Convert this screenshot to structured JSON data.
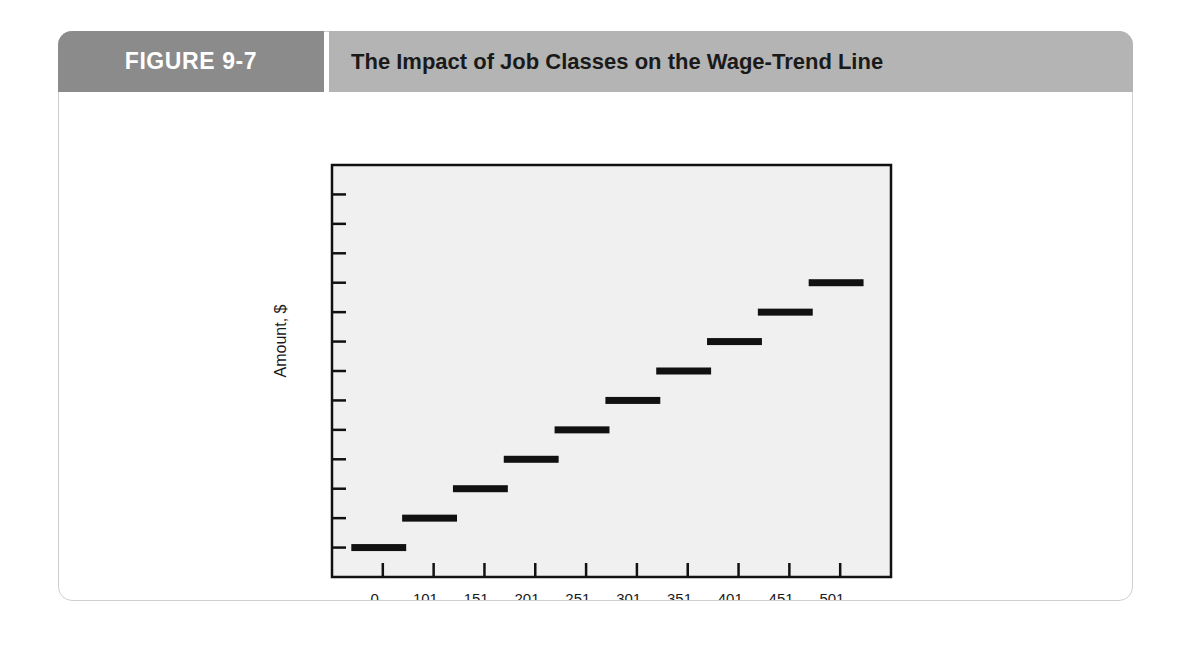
{
  "figure": {
    "number_label": "FIGURE 9-7",
    "title": "The Impact of Job Classes on the Wage-Trend Line"
  },
  "colors": {
    "tab_gray": "#8b8b8b",
    "title_band_gray": "#b4b4b4",
    "card_border": "#cfcfcf",
    "plot_background": "#f0f0f0",
    "plot_border": "#111111",
    "bar_color": "#111111",
    "page_background": "#ffffff"
  },
  "chart_data": {
    "type": "bar",
    "title": "The Impact of Job Classes on the Wage-Trend Line",
    "xlabel": "",
    "ylabel": "Amount, $",
    "categories": [
      "0–\n100",
      "101–\n150",
      "151–\n200",
      "201–\n250",
      "251–\n300",
      "301–\n350",
      "351–\n400",
      "401–\n450",
      "451–\n500",
      "501–\n550"
    ],
    "category_lines": [
      [
        "0–",
        "100"
      ],
      [
        "101–",
        "150"
      ],
      [
        "151–",
        "200"
      ],
      [
        "201–",
        "250"
      ],
      [
        "251–",
        "300"
      ],
      [
        "301–",
        "350"
      ],
      [
        "351–",
        "400"
      ],
      [
        "401–",
        "450"
      ],
      [
        "451–",
        "500"
      ],
      [
        "501–",
        "550"
      ]
    ],
    "values": [
      1,
      2,
      3,
      4,
      5,
      6,
      7,
      8,
      9,
      10
    ],
    "ylim": [
      0,
      13.5
    ],
    "y_tick_count": 13,
    "y_tick_labels": [],
    "x_tick_count": 10,
    "grid": false,
    "legend": null,
    "annotations": [],
    "note": "Step-wise horizontal bars: each job class sits one tick level above the previous, forming an ascending wage-trend staircase."
  }
}
